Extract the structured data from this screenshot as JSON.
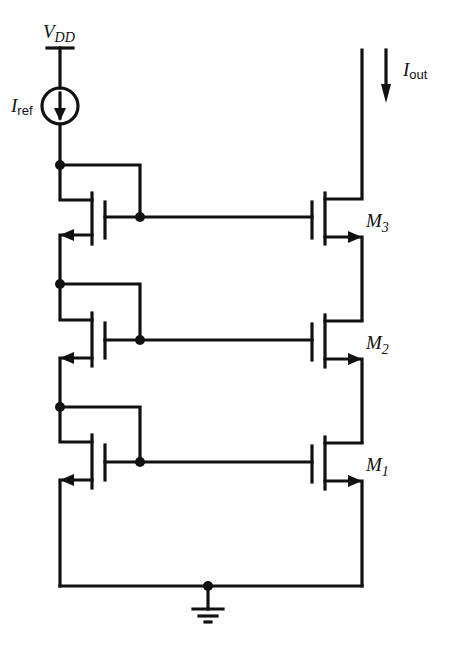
{
  "diagram": {
    "supply": {
      "label": "V",
      "sub": "DD"
    },
    "ref_source": {
      "label": "I",
      "sub": "ref"
    },
    "output": {
      "label": "I",
      "sub": "out"
    },
    "transistors": [
      {
        "label": "M",
        "sub": "3"
      },
      {
        "label": "M",
        "sub": "2"
      },
      {
        "label": "M",
        "sub": "1"
      }
    ],
    "ground": "ground"
  }
}
